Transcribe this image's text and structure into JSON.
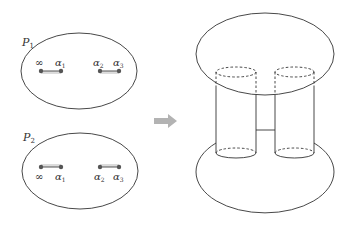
{
  "colors": {
    "stroke": "#333333",
    "cut": "#555555",
    "hatch": "#888888",
    "arrow": "#b3b3b3",
    "background": "#ffffff"
  },
  "left_panel": {
    "sheets": [
      {
        "label": "P",
        "label_sub": "1",
        "points_above": true,
        "cuts": [
          {
            "from": "∞",
            "to": "α",
            "to_sub": "1"
          },
          {
            "from": "α",
            "from_sub": "2",
            "to": "α",
            "to_sub": "3"
          }
        ]
      },
      {
        "label": "P",
        "label_sub": "2",
        "points_above": false,
        "cuts": [
          {
            "from": "∞",
            "to": "α",
            "to_sub": "1"
          },
          {
            "from": "α",
            "from_sub": "2",
            "to": "α",
            "to_sub": "3"
          }
        ]
      }
    ]
  },
  "arrow": {
    "icon": "right-arrow-icon",
    "direction": "right"
  },
  "right_panel": {
    "description": "Two sheets glued along branch cuts forming a surface with two tubes (genus-1 surface)",
    "components": [
      "top-sheet-ellipse",
      "bottom-sheet-ellipse",
      "left-tube",
      "right-tube",
      "bridge"
    ]
  }
}
